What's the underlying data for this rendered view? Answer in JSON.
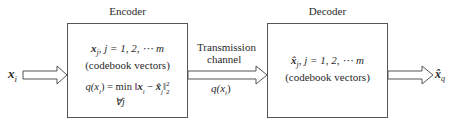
{
  "input": {
    "symbol": "x",
    "subscript": "i"
  },
  "encoder": {
    "title": "Encoder",
    "codebook_line": {
      "var": "x",
      "sub": "j",
      "rest": ", j = 1, 2, ⋯ m"
    },
    "codebook_note": "(codebook vectors)",
    "formula": {
      "lhs": "q(x",
      "lhs_sub": "i",
      "lhs_end": ") = min",
      "norm_open": "‖",
      "x": "x",
      "x_sub": "i",
      "minus": " − ",
      "xhat": "x̂",
      "xhat_sub": "j",
      "norm_close": "‖",
      "sup": "2",
      "sub": "2",
      "under": "∀j"
    }
  },
  "channel": {
    "label_line1": "Transmission",
    "label_line2": "channel",
    "signal": "q(x",
    "signal_sub": "i",
    "signal_end": ")"
  },
  "decoder": {
    "title": "Decoder",
    "codebook_line": {
      "var": "x̂",
      "sub": "j",
      "rest": ", j = 1, 2, ⋯ m"
    },
    "codebook_note": "(codebook vectors)"
  },
  "output": {
    "symbol": "x̂",
    "subscript": "q"
  },
  "colors": {
    "stroke": "#555555",
    "text": "#2a2a2a"
  }
}
